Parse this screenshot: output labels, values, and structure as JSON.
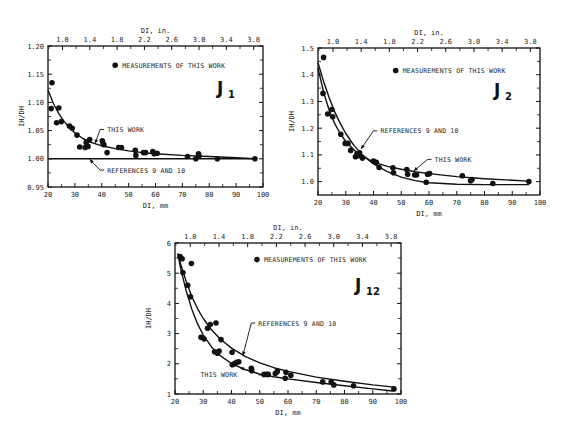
{
  "chart_data": [
    {
      "type": "scatter",
      "panel": "J1",
      "title": "J1",
      "xlabel": "DI, mm",
      "x2label": "DI, in.",
      "ylabel": "IH/DH",
      "xlim": [
        20,
        100
      ],
      "ylim": [
        0.95,
        1.2
      ],
      "x_ticks": [
        20,
        30,
        40,
        50,
        60,
        70,
        80,
        90,
        100
      ],
      "x2_ticks": [
        "1.0",
        "1.4",
        "1.8",
        "2.2",
        "2.6",
        "3.0",
        "3.4",
        "3.8"
      ],
      "y_ticks": [
        "0.95",
        "1.00",
        "1.05",
        "1.10",
        "1.15",
        "1.20"
      ],
      "y_tick_values": [
        0.95,
        1.0,
        1.05,
        1.1,
        1.15,
        1.2
      ],
      "frame": {
        "left": 48,
        "right": 263,
        "top": 46,
        "bottom": 187
      },
      "legend": {
        "label": "MEASUREMENTS OF THIS WORK",
        "x": 45,
        "y": 1.166
      },
      "points": [
        [
          21.5,
          1.135
        ],
        [
          21.2,
          1.089
        ],
        [
          23.2,
          1.064
        ],
        [
          24.0,
          1.09
        ],
        [
          25.0,
          1.066
        ],
        [
          28.0,
          1.058
        ],
        [
          29.0,
          1.054
        ],
        [
          30.8,
          1.042
        ],
        [
          31.8,
          1.021
        ],
        [
          33.8,
          1.02
        ],
        [
          34.2,
          1.029
        ],
        [
          34.9,
          1.022
        ],
        [
          35.5,
          1.034
        ],
        [
          40.2,
          1.032
        ],
        [
          40.5,
          1.027
        ],
        [
          40.8,
          1.025
        ],
        [
          42.0,
          1.011
        ],
        [
          46.3,
          1.02
        ],
        [
          47.3,
          1.02
        ],
        [
          52.5,
          1.015
        ],
        [
          52.7,
          1.006
        ],
        [
          55.5,
          1.011
        ],
        [
          56.3,
          1.011
        ],
        [
          59.0,
          1.013
        ],
        [
          59.5,
          1.009
        ],
        [
          60.6,
          1.01
        ],
        [
          71.9,
          1.004
        ],
        [
          75.0,
          1.0
        ],
        [
          76.0,
          1.009
        ],
        [
          76.2,
          1.005
        ],
        [
          83.0,
          1.0
        ],
        [
          97.0,
          1.0
        ]
      ],
      "series": [
        {
          "name": "THIS WORK",
          "x": [
            20,
            22,
            24,
            26,
            28,
            30,
            33,
            36,
            40,
            45,
            50,
            55,
            60,
            70,
            80,
            90,
            97
          ],
          "y": [
            1.122,
            1.098,
            1.08,
            1.066,
            1.055,
            1.046,
            1.036,
            1.029,
            1.023,
            1.018,
            1.014,
            1.011,
            1.009,
            1.006,
            1.004,
            1.002,
            1.0
          ]
        },
        {
          "name": "REFERENCES 9 AND 10",
          "x": [
            20,
            97
          ],
          "y": [
            1.0,
            1.0
          ]
        }
      ],
      "annotations": [
        {
          "text": "THIS WORK",
          "x": 42,
          "y": 1.052,
          "arrow_to": [
            37.5,
            1.027
          ]
        },
        {
          "text": "REFERENCES 9 AND 10",
          "x": 42,
          "y": 0.98,
          "arrow_to": [
            35.5,
            0.999
          ]
        }
      ]
    },
    {
      "type": "scatter",
      "panel": "J2",
      "title": "J2",
      "xlabel": "DI, mm",
      "x2label": "DI, in.",
      "ylabel": "IH/DH",
      "xlim": [
        20,
        100
      ],
      "ylim": [
        0.95,
        1.5
      ],
      "x_ticks": [
        20,
        30,
        40,
        50,
        60,
        70,
        80,
        90,
        100
      ],
      "x2_ticks": [
        "1.0",
        "1.4",
        "1.8",
        "2.2",
        "2.6",
        "3.0",
        "3.4",
        "3.8"
      ],
      "y_ticks": [
        "1.0",
        "1.1",
        "1.2",
        "1.3",
        "1.4",
        "1.5"
      ],
      "y_tick_values": [
        1.0,
        1.1,
        1.2,
        1.3,
        1.4,
        1.5
      ],
      "frame": {
        "left": 318,
        "right": 540,
        "top": 48,
        "bottom": 195
      },
      "legend": {
        "label": "MEASUREMENTS OF THIS WORK",
        "x": 48,
        "y": 1.416
      },
      "points": [
        [
          22.0,
          1.465
        ],
        [
          21.8,
          1.33
        ],
        [
          23.5,
          1.253
        ],
        [
          25.0,
          1.27
        ],
        [
          25.3,
          1.243
        ],
        [
          28.2,
          1.177
        ],
        [
          29.8,
          1.143
        ],
        [
          30.8,
          1.143
        ],
        [
          31.8,
          1.117
        ],
        [
          33.5,
          1.093
        ],
        [
          34.0,
          1.103
        ],
        [
          34.7,
          1.097
        ],
        [
          35.0,
          1.108
        ],
        [
          36.0,
          1.088
        ],
        [
          40.0,
          1.077
        ],
        [
          41.0,
          1.072
        ],
        [
          42.0,
          1.053
        ],
        [
          47.0,
          1.052
        ],
        [
          47.2,
          1.033
        ],
        [
          52.0,
          1.045
        ],
        [
          52.3,
          1.028
        ],
        [
          54.8,
          1.025
        ],
        [
          55.5,
          1.025
        ],
        [
          59.0,
          0.998
        ],
        [
          59.5,
          1.028
        ],
        [
          60.2,
          1.03
        ],
        [
          72.0,
          1.022
        ],
        [
          75.0,
          1.003
        ],
        [
          75.5,
          1.008
        ],
        [
          83.0,
          0.993
        ],
        [
          96.0,
          1.0
        ]
      ],
      "series": [
        {
          "name": "THIS WORK",
          "x": [
            20,
            22,
            24,
            26,
            28,
            30,
            33,
            36,
            40,
            45,
            50,
            55,
            60,
            70,
            80,
            90,
            96
          ],
          "y": [
            1.425,
            1.335,
            1.268,
            1.218,
            1.18,
            1.15,
            1.118,
            1.095,
            1.073,
            1.057,
            1.046,
            1.037,
            1.03,
            1.019,
            1.011,
            1.005,
            1.002
          ]
        },
        {
          "name": "REFERENCES 9 AND 10",
          "x": [
            20,
            22,
            24,
            26,
            28,
            30,
            33,
            36,
            40,
            45,
            50,
            55,
            60,
            70,
            80,
            90,
            96
          ],
          "y": [
            1.445,
            1.375,
            1.315,
            1.262,
            1.218,
            1.18,
            1.135,
            1.1,
            1.066,
            1.037,
            1.017,
            1.004,
            0.996,
            0.99,
            0.989,
            0.989,
            0.989
          ]
        }
      ],
      "annotations": [
        {
          "text": "REFERENCES 9 AND 10",
          "x": 42.5,
          "y": 1.19,
          "arrow_to": [
            35.5,
            1.122
          ]
        },
        {
          "text": "THIS WORK",
          "x": 62,
          "y": 1.083,
          "arrow_to": [
            54.5,
            1.04
          ]
        }
      ]
    },
    {
      "type": "scatter",
      "panel": "J12",
      "title": "J12",
      "xlabel": "DI, mm",
      "x2label": "DI, in.",
      "ylabel": "IH/DH",
      "xlim": [
        20,
        100
      ],
      "ylim": [
        1,
        6
      ],
      "x_ticks": [
        20,
        30,
        40,
        50,
        60,
        70,
        80,
        90,
        100
      ],
      "x2_ticks": [
        "1.0",
        "1.4",
        "1.8",
        "2.2",
        "2.6",
        "3.0",
        "3.4",
        "3.8"
      ],
      "y_ticks": [
        "1",
        "2",
        "3",
        "4",
        "5",
        "6"
      ],
      "y_tick_values": [
        1,
        2,
        3,
        4,
        5,
        6
      ],
      "frame": {
        "left": 175,
        "right": 401,
        "top": 243,
        "bottom": 394
      },
      "legend": {
        "label": "MEASUREMENTS OF THIS WORK",
        "x": 49,
        "y": 5.45
      },
      "points": [
        [
          21.8,
          5.55
        ],
        [
          22.5,
          5.48
        ],
        [
          22.8,
          5.02
        ],
        [
          25.8,
          5.32
        ],
        [
          24.5,
          4.6
        ],
        [
          25.5,
          4.22
        ],
        [
          29.2,
          2.88
        ],
        [
          30.3,
          2.82
        ],
        [
          31.5,
          3.18
        ],
        [
          32.5,
          3.3
        ],
        [
          34.5,
          3.35
        ],
        [
          34.0,
          2.4
        ],
        [
          35.0,
          2.35
        ],
        [
          35.6,
          2.42
        ],
        [
          36.3,
          2.8
        ],
        [
          40.2,
          2.38
        ],
        [
          40.3,
          1.97
        ],
        [
          41.0,
          2.0
        ],
        [
          41.8,
          2.05
        ],
        [
          42.6,
          2.07
        ],
        [
          47.0,
          1.85
        ],
        [
          47.2,
          1.77
        ],
        [
          51.5,
          1.65
        ],
        [
          52.5,
          1.65
        ],
        [
          53.0,
          1.65
        ],
        [
          55.5,
          1.68
        ],
        [
          56.2,
          1.75
        ],
        [
          59.0,
          1.52
        ],
        [
          59.3,
          1.72
        ],
        [
          61.0,
          1.62
        ],
        [
          72.3,
          1.4
        ],
        [
          75.3,
          1.4
        ],
        [
          76.2,
          1.3
        ],
        [
          83.2,
          1.27
        ],
        [
          97.5,
          1.17
        ]
      ],
      "series": [
        {
          "name": "THIS WORK",
          "x": [
            21,
            22,
            24,
            26,
            28,
            30,
            33,
            36,
            40,
            45,
            50,
            55,
            60,
            70,
            80,
            90,
            97
          ],
          "y": [
            5.65,
            5.15,
            4.4,
            3.8,
            3.32,
            2.95,
            2.55,
            2.27,
            2.01,
            1.8,
            1.66,
            1.57,
            1.5,
            1.38,
            1.27,
            1.17,
            1.1
          ]
        },
        {
          "name": "REFERENCES 9 AND 10",
          "x": [
            21,
            22,
            24,
            26,
            28,
            30,
            33,
            36,
            40,
            45,
            50,
            55,
            60,
            70,
            80,
            90,
            97.5
          ],
          "y": [
            5.65,
            5.3,
            4.72,
            4.22,
            3.82,
            3.5,
            3.12,
            2.82,
            2.52,
            2.24,
            2.03,
            1.87,
            1.75,
            1.56,
            1.42,
            1.3,
            1.23
          ]
        }
      ],
      "annotations": [
        {
          "text": "REFERENCES 9 AND 10",
          "x": 49.5,
          "y": 3.35,
          "arrow_to": [
            44,
            2.27
          ]
        },
        {
          "text": "THIS WORK",
          "x": 29,
          "y": 1.63,
          "arrow_to": [
            43.0,
            1.87
          ]
        }
      ]
    }
  ],
  "page": {
    "legend_label": "MEASUREMENTS OF THIS WORK"
  }
}
